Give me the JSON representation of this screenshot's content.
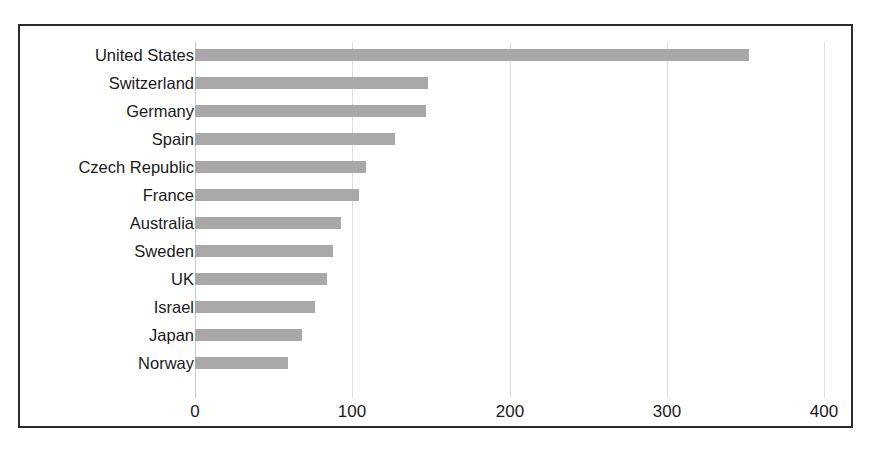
{
  "figure": {
    "background_color": "#ffffff",
    "frame_color": "#2b2b2b",
    "bar_color": "#a8a8a8",
    "gridline_color": "#dddddd"
  },
  "chart_data": {
    "type": "bar",
    "orientation": "horizontal",
    "title": "",
    "subtitle": "",
    "xlabel": "",
    "ylabel": "",
    "xlim": [
      0,
      400
    ],
    "xticks": [
      0,
      100,
      200,
      300,
      400
    ],
    "xtick_labels": [
      "0",
      "100",
      "200",
      "300",
      "400"
    ],
    "grid": true,
    "grid_axis": "x",
    "legend": false,
    "legend_position": "none",
    "categories": [
      "United States",
      "Switzerland",
      "Germany",
      "Spain",
      "Czech Republic",
      "France",
      "Australia",
      "Sweden",
      "UK",
      "Israel",
      "Japan",
      "Norway"
    ],
    "values": [
      352,
      148,
      147,
      127,
      109,
      104,
      93,
      88,
      84,
      76,
      68,
      59
    ],
    "series": [
      {
        "name": "",
        "values": [
          352,
          148,
          147,
          127,
          109,
          104,
          93,
          88,
          84,
          76,
          68,
          59
        ]
      }
    ]
  }
}
